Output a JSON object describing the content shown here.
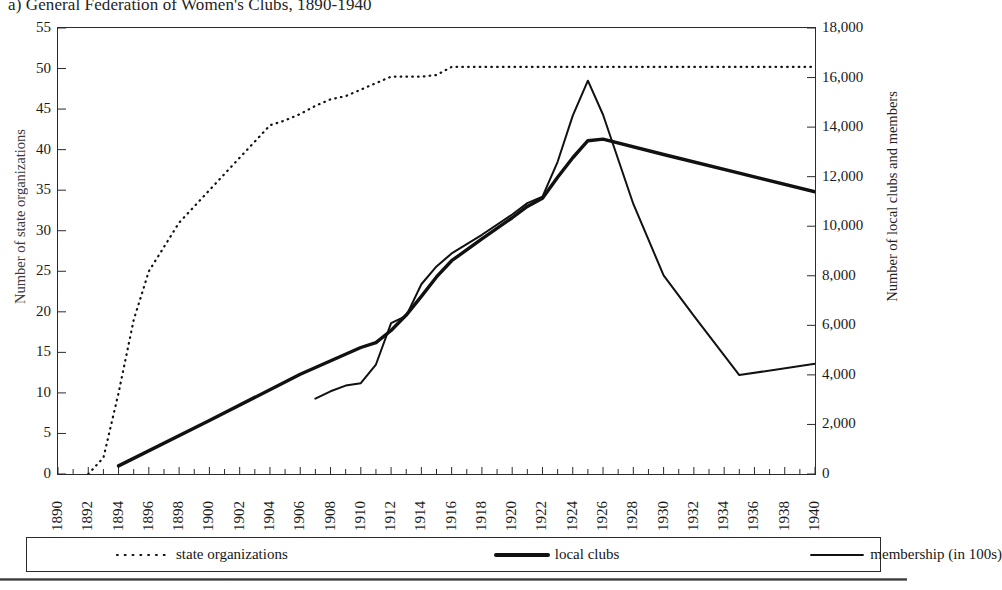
{
  "figure": {
    "title": "a) General Federation of Women's Clubs, 1890-1940"
  },
  "axes": {
    "y_left_title": "Number of state organizations",
    "y_right_title": "Number of local clubs and members",
    "x_title": ""
  },
  "legend": {
    "items": [
      {
        "label": "state organizations",
        "style": "dotted",
        "color": "#111111"
      },
      {
        "label": "local clubs",
        "style": "thick-solid",
        "color": "#111111"
      },
      {
        "label": "membership (in 100s)",
        "style": "thin-solid",
        "color": "#111111"
      }
    ]
  },
  "chart_data": {
    "type": "line",
    "title": "a) General Federation of Women's Clubs, 1890-1940",
    "xlabel": "",
    "ylabel": "Number of state organizations",
    "y2label": "Number of local clubs and members",
    "xlim": [
      1890,
      1940
    ],
    "ylim": [
      0,
      55
    ],
    "y2lim": [
      0,
      18000
    ],
    "grid": false,
    "legend_position": "bottom",
    "x_ticks": [
      1890,
      1892,
      1894,
      1896,
      1898,
      1900,
      1902,
      1904,
      1906,
      1908,
      1910,
      1912,
      1914,
      1916,
      1918,
      1920,
      1922,
      1924,
      1926,
      1928,
      1930,
      1932,
      1934,
      1936,
      1938,
      1940
    ],
    "x_tick_labels": [
      "1890",
      "1892",
      "1894",
      "1896",
      "1898",
      "1900",
      "1902",
      "1904",
      "1906",
      "1908",
      "1910",
      "1912",
      "1914",
      "1916",
      "1918",
      "1920",
      "1922",
      "1924",
      "1926",
      "1928",
      "1930",
      "1932",
      "1934",
      "1936",
      "1938",
      "1940"
    ],
    "x_minor_ticks_every": 1,
    "y_left_ticks": [
      0,
      5,
      10,
      15,
      20,
      25,
      30,
      35,
      40,
      45,
      50,
      55
    ],
    "y_left_tick_labels": [
      "0",
      "5",
      "10",
      "15",
      "20",
      "25",
      "30",
      "35",
      "40",
      "45",
      "50",
      "55"
    ],
    "y_right_ticks": [
      0,
      2000,
      4000,
      6000,
      8000,
      10000,
      12000,
      14000,
      16000,
      18000
    ],
    "y_right_tick_labels": [
      "0",
      "2,000",
      "4,000",
      "6,000",
      "8,000",
      "10,000",
      "12,000",
      "14,000",
      "16,000",
      "18,000"
    ],
    "series": [
      {
        "name": "state organizations",
        "axis": "left",
        "style": "dotted",
        "linewidth": 2.2,
        "x": [
          1892,
          1893,
          1894,
          1895,
          1896,
          1897,
          1898,
          1899,
          1900,
          1901,
          1902,
          1903,
          1904,
          1905,
          1906,
          1907,
          1908,
          1909,
          1910,
          1911,
          1912,
          1913,
          1914,
          1915,
          1916,
          1917,
          1920,
          1925,
          1930,
          1935,
          1940
        ],
        "values": [
          0,
          2,
          10,
          19,
          25,
          28,
          31,
          33,
          35,
          37,
          39,
          41,
          43,
          43.6,
          44.4,
          45.4,
          46.2,
          46.6,
          47.4,
          48.2,
          49,
          49,
          49,
          49.2,
          50.2,
          50.2,
          50.2,
          50.2,
          50.2,
          50.2,
          50.2
        ]
      },
      {
        "name": "local clubs",
        "axis": "right",
        "style": "thick-solid",
        "linewidth": 3.4,
        "x": [
          1894,
          1900,
          1906,
          1910,
          1911,
          1912,
          1913,
          1914,
          1915,
          1916,
          1918,
          1920,
          1921,
          1922,
          1923,
          1924,
          1925,
          1926,
          1930,
          1935,
          1940
        ],
        "values_left_scale": [
          1,
          6.6,
          12.3,
          15.6,
          16.2,
          17.7,
          19.6,
          21.9,
          24.3,
          26.3,
          29,
          31.6,
          33,
          34,
          36.6,
          39,
          41.1,
          41.3,
          39.4,
          37.1,
          34.8
        ],
        "values": [
          327,
          2160,
          4025,
          5105,
          5300,
          5793,
          6415,
          7167,
          7953,
          8607,
          9491,
          10342,
          10800,
          11127,
          11978,
          12764,
          13451,
          13517,
          12895,
          12142,
          11389
        ]
      },
      {
        "name": "membership (in 100s)",
        "axis": "right",
        "style": "thin-solid",
        "linewidth": 2.0,
        "x": [
          1907,
          1908,
          1909,
          1910,
          1911,
          1912,
          1913,
          1914,
          1915,
          1916,
          1918,
          1920,
          1921,
          1922,
          1923,
          1924,
          1925,
          1926,
          1928,
          1930,
          1932,
          1935,
          1940
        ],
        "values_left_scale": [
          9.3,
          10.2,
          10.9,
          11.2,
          13.5,
          18.6,
          19.5,
          23.4,
          25.6,
          27.2,
          29.5,
          32,
          33.4,
          34.2,
          38.5,
          44.2,
          48.5,
          44.3,
          33.3,
          24.5,
          19.5,
          12.2,
          13.6
        ],
        "values": [
          3044,
          3338,
          3567,
          3665,
          4418,
          6087,
          6382,
          7658,
          8378,
          8902,
          9655,
          10473,
          10931,
          11193,
          12600,
          14465,
          15873,
          14498,
          10898,
          8018,
          6382,
          3993,
          4451
        ]
      }
    ]
  }
}
